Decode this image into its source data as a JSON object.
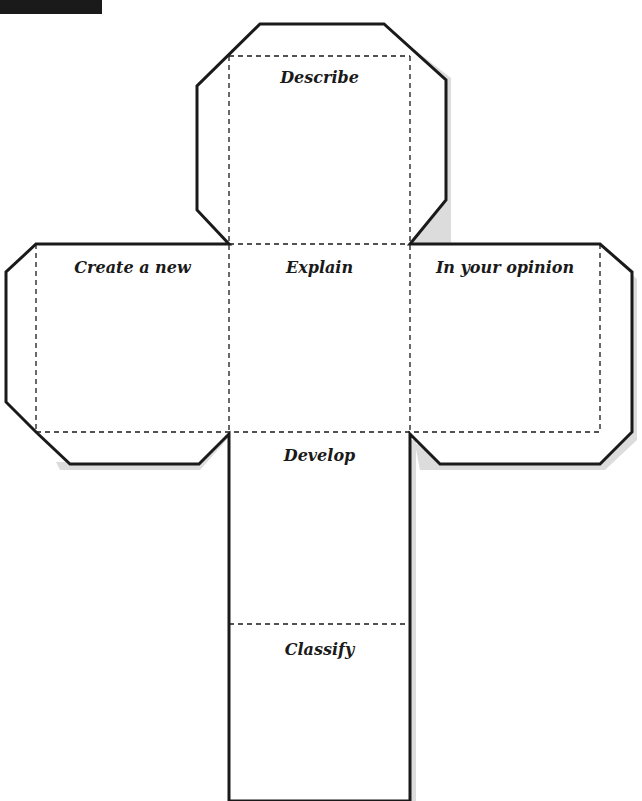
{
  "faces": {
    "top": "Describe",
    "left": "Create a new",
    "center": "Explain",
    "right": "In your opinion",
    "below": "Develop",
    "bottom": "Classify"
  },
  "colors": {
    "outline": "#1a1a1a",
    "shadow": "#d6d6d6",
    "background": "#ffffff"
  }
}
